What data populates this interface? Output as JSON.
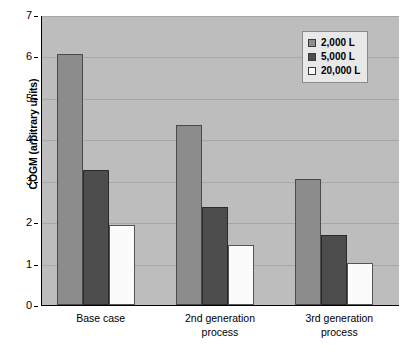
{
  "chart_data": {
    "type": "bar",
    "title": "",
    "subtitle": "",
    "xlabel": "",
    "ylabel": "COGM (arbitrary units)",
    "ylim": [
      0,
      7
    ],
    "ytick_labels": [
      "7",
      "6",
      "5",
      "4",
      "3",
      "2",
      "1",
      "0"
    ],
    "ytick_values": [
      7,
      6,
      5,
      4,
      3,
      2,
      1,
      0
    ],
    "grid": true,
    "grid_axis": "y",
    "legend_position": "top-right",
    "categories": [
      "Base case",
      "2nd generation process",
      "3rd generation process"
    ],
    "category_lines": [
      [
        "Base case"
      ],
      [
        "2nd generation",
        "process"
      ],
      [
        "3rd generation",
        "process"
      ]
    ],
    "series": [
      {
        "name": "2,000 L",
        "color": "#8c8c8c",
        "values": [
          6.05,
          4.34,
          3.05
        ]
      },
      {
        "name": "5,000 L",
        "color": "#4d4d4d",
        "values": [
          3.27,
          2.36,
          1.68
        ]
      },
      {
        "name": "20,000 L",
        "color": "#fbfbfb",
        "values": [
          1.92,
          1.46,
          1.02
        ]
      }
    ],
    "plot_background": "#bdbdbd",
    "gridline_color": "#a6a6a6",
    "axis_color": "#000000"
  }
}
